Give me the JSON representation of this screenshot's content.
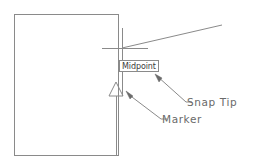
{
  "diagram": {
    "background_color": "#ffffff",
    "line_color": "#8a8a8a",
    "text_color": "#6a6a6a",
    "tooltip_text_color": "#3b3b3b",
    "tooltip_border_color": "#8a8a8a",
    "tooltip_fill_color": "#ffffff"
  },
  "tooltip": {
    "label": "Midpoint",
    "name": "snap-tooltip"
  },
  "callouts": [
    {
      "label": "Snap Tip",
      "name": "snap-tip-callout"
    },
    {
      "label": "Marker",
      "name": "marker-callout"
    }
  ],
  "shapes": {
    "rectangle": {
      "name": "object-rectangle",
      "x": 14,
      "y": 14,
      "width": 104,
      "height": 141
    },
    "crosshair": {
      "name": "crosshair-cursor",
      "cx": 122,
      "cy": 48,
      "h_x1": 102,
      "h_x2": 148,
      "v_y1": 28,
      "v_y2": 96
    },
    "diagonal_line": {
      "name": "object-line",
      "x1": 122,
      "y1": 48,
      "x2": 222,
      "y2": 25
    },
    "marker_triangle": {
      "name": "midpoint-marker-triangle",
      "cx": 116,
      "cy": 89,
      "size": 13
    },
    "leader_snap_tip": {
      "name": "snap-tip-leader",
      "x1": 156,
      "y1": 75,
      "x2": 186,
      "y2": 102
    },
    "leader_marker": {
      "name": "marker-leader",
      "x1": 127,
      "y1": 92,
      "x2": 161,
      "y2": 119
    }
  }
}
